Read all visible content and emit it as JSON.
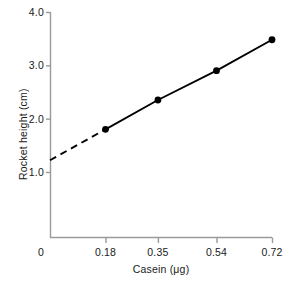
{
  "chart_data": {
    "type": "line",
    "title": "",
    "subtitle": "",
    "xlabel": "Casein (μg)",
    "ylabel": "Rocket height (cm)",
    "xlim": [
      0,
      0.72
    ],
    "ylim": [
      0,
      4.0
    ],
    "grid": false,
    "legend": null,
    "x": [
      0.18,
      0.35,
      0.54,
      0.72
    ],
    "values": [
      1.8,
      2.35,
      2.9,
      3.48
    ],
    "series": [
      {
        "name": "Rocket height vs casein",
        "x": [
          0.18,
          0.35,
          0.54,
          0.72
        ],
        "values": [
          1.8,
          2.35,
          2.9,
          3.48
        ],
        "marker": "filled-circle",
        "color": "#000000",
        "line_style": "solid"
      },
      {
        "name": "Extrapolated fit to y-axis",
        "x": [
          0.0,
          0.18
        ],
        "values": [
          1.22,
          1.8
        ],
        "marker": "none",
        "color": "#000000",
        "line_style": "dashed"
      }
    ],
    "xticks": [
      0,
      0.18,
      0.35,
      0.54,
      0.72
    ],
    "xticklabels": [
      "0",
      "0.18",
      "0.35",
      "0.54",
      "0.72"
    ],
    "yticks": [
      1.0,
      2.0,
      3.0,
      4.0
    ],
    "yticklabels": [
      "1.0",
      "2.0",
      "3.0",
      "4.0"
    ],
    "y_intercept": 1.22,
    "annotations": []
  },
  "axes": {
    "y_title": "Rocket height (cm)",
    "x_title": "Casein (μg)",
    "y_ticks": [
      {
        "label": "4.0",
        "value": 4.0
      },
      {
        "label": "3.0",
        "value": 3.0
      },
      {
        "label": "2.0",
        "value": 2.0
      },
      {
        "label": "1.0",
        "value": 1.0
      }
    ],
    "x_ticks": [
      {
        "label": "0",
        "value": 0
      },
      {
        "label": "0.18",
        "value": 0.18
      },
      {
        "label": "0.35",
        "value": 0.35
      },
      {
        "label": "0.54",
        "value": 0.54
      },
      {
        "label": "0.72",
        "value": 0.72
      }
    ]
  },
  "style": {
    "axis_color": "#9a9a9a",
    "data_color": "#000000",
    "text_color": "#1a1a1a",
    "background": "#ffffff"
  }
}
